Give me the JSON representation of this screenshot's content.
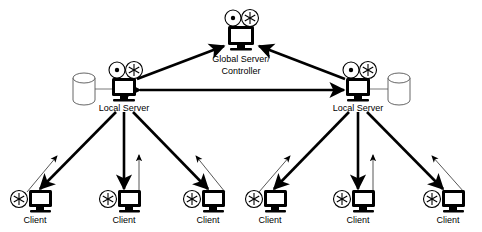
{
  "diagram": {
    "background_color": "#ffffff",
    "stroke_color": "#000000",
    "thin_stroke_color": "#444444",
    "width": 482,
    "height": 232
  },
  "nodes": {
    "global_server": {
      "label_line1": "Global Server/",
      "label_line2": "Controller",
      "icon": "monitor-with-dot-and-asterisk",
      "x": 241,
      "y": 34
    },
    "local_servers": [
      {
        "label": "Local Server",
        "icon": "monitor-with-dot-and-asterisk",
        "x": 124,
        "y": 86,
        "db_x": 84,
        "db_y": 88
      },
      {
        "label": "Local Server",
        "icon": "monitor-with-dot-and-asterisk",
        "x": 358,
        "y": 86,
        "db_x": 399,
        "db_y": 88
      }
    ],
    "databases": [
      {
        "name": "storage-cylinder",
        "x": 84,
        "y": 88
      },
      {
        "name": "storage-cylinder",
        "x": 399,
        "y": 88
      }
    ],
    "clients": [
      {
        "label": "Client",
        "icon": "monitor-with-asterisk",
        "x": 35,
        "y": 200,
        "parent": 0
      },
      {
        "label": "Client",
        "icon": "monitor-with-asterisk",
        "x": 124,
        "y": 200,
        "parent": 0
      },
      {
        "label": "Client",
        "icon": "monitor-with-asterisk",
        "x": 208,
        "y": 200,
        "parent": 0
      },
      {
        "label": "Client",
        "icon": "monitor-with-asterisk",
        "x": 270,
        "y": 200,
        "parent": 1
      },
      {
        "label": "Client",
        "icon": "monitor-with-asterisk",
        "x": 358,
        "y": 200,
        "parent": 1
      },
      {
        "label": "Client",
        "icon": "monitor-with-asterisk",
        "x": 448,
        "y": 200,
        "parent": 1
      }
    ]
  },
  "edges": {
    "server_uplinks": [
      {
        "from": "local-server-left",
        "to": "global-server",
        "style": "thick",
        "direction": "up"
      },
      {
        "from": "local-server-right",
        "to": "global-server",
        "style": "thick",
        "direction": "up"
      }
    ],
    "peer_link": {
      "from": "local-server-left",
      "to": "local-server-right",
      "style": "thick",
      "direction": "bidirectional"
    },
    "downlinks_note": "thick arrow server to client",
    "uplinks_note": "thin arrow client to server"
  }
}
